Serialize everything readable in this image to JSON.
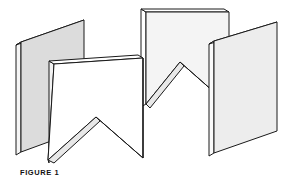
{
  "figure": {
    "caption": "FIGURE 1",
    "title": "FIGURE 1",
    "background_color": "#ffffff",
    "stroke_color": "#1a1a1a",
    "stroke_width": 1.0,
    "face_color_shaded": "#dcdcdc",
    "face_color_light": "#f0f0f0",
    "edge_color": "#ffffff",
    "panels": [
      {
        "id": "panel-back-left",
        "name": "back-left-panel",
        "face_color": "#dcdcdc",
        "edge_color": "#f5f5f5",
        "outline": "21,42 84,20 84,129 21,152",
        "edge": "21,42 16,45 16,155 21,152",
        "top_edge": "21,42 16,45 79,23 84,20"
      },
      {
        "id": "panel-back-middle",
        "name": "back-middle-panel",
        "face_color": "#f4f4f4",
        "edge_color": "#ffffff",
        "outline": "146,12 229,12 229,64 180,62 146,104",
        "edge": "146,12 141,9 141,107 146,104",
        "top_edge": "146,12 141,9 224,9 229,12"
      },
      {
        "id": "panel-front-left",
        "name": "front-left-panel-notched",
        "face_color": "#ffffff",
        "edge_color": "#f0f0f0",
        "outline": "54,64 143,58 143,158 96,117 48,160",
        "edge": "54,64 49,61 49,163 48,160",
        "top_edge": "54,64 49,61 138,55 143,58"
      },
      {
        "id": "panel-front-right",
        "name": "front-right-panel",
        "face_color": "#ededed",
        "edge_color": "#fafafa",
        "outline": "214,41 277,22 277,131 214,153",
        "edge": "214,41 209,44 209,156 214,153",
        "top_edge": "214,41 209,44 272,25 277,22"
      }
    ],
    "notches": [
      {
        "id": "notch-front",
        "name": "front-panel-v-notch",
        "apex": [
          96,
          117
        ],
        "left": [
          48,
          160
        ],
        "right": [
          143,
          158
        ]
      },
      {
        "id": "notch-connector",
        "name": "connector-v-notch",
        "apex": [
          180,
          62
        ],
        "left": [
          146,
          104
        ],
        "right": [
          214,
          92
        ]
      }
    ]
  }
}
